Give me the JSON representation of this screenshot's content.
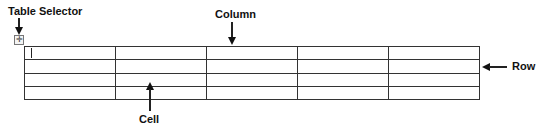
{
  "diagram": {
    "labels": {
      "table_selector": "Table Selector",
      "column": "Column",
      "row": "Row",
      "cell": "Cell"
    },
    "table_selector_icon": "move-cross-icon",
    "table": {
      "rows": 4,
      "columns": 5,
      "cells": [
        [
          "",
          "",
          "",
          "",
          ""
        ],
        [
          "",
          "",
          "",
          "",
          ""
        ],
        [
          "",
          "",
          "",
          "",
          ""
        ],
        [
          "",
          "",
          "",
          "",
          ""
        ]
      ]
    },
    "colors": {
      "line": "#222222",
      "text": "#111111",
      "background": "#ffffff"
    }
  }
}
